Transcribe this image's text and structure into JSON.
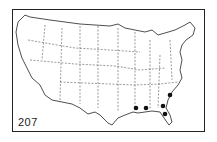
{
  "map": {
    "title": "United States outline map",
    "figure_number": "207",
    "colors": {
      "lines": "#222222",
      "markers": "#111111",
      "background": "#ffffff"
    },
    "markers": [
      {
        "name": "Louisiana / Mississippi coast"
      },
      {
        "name": "Alabama coast"
      },
      {
        "name": "Southeast Georgia"
      },
      {
        "name": "South Carolina"
      },
      {
        "name": "Northeast Florida"
      }
    ]
  }
}
